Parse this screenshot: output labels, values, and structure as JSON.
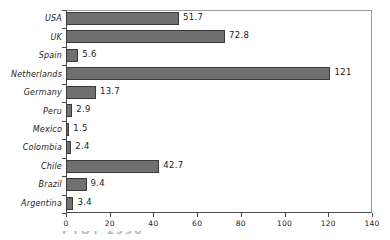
{
  "chart_data": {
    "type": "bar",
    "orientation": "horizontal",
    "title": "",
    "xlabel": "",
    "ylabel": "",
    "categories": [
      "USA",
      "UK",
      "Spain",
      "Netherlands",
      "Germany",
      "Peru",
      "Mexico",
      "Colombia",
      "Chile",
      "Brazil",
      "Argentina"
    ],
    "values": [
      51.7,
      72.8,
      5.6,
      121,
      13.7,
      2.9,
      1.5,
      2.4,
      42.7,
      9.4,
      3.4
    ],
    "value_labels": [
      "51.7",
      "72.8",
      "5.6",
      "121",
      "13.7",
      "2.9",
      "1.5",
      "2.4",
      "42.7",
      "9.4",
      "3.4"
    ],
    "xlim": [
      0,
      140
    ],
    "xticks": [
      0,
      20,
      40,
      60,
      80,
      100,
      120,
      140
    ],
    "xtick_labels": [
      "0",
      "20",
      "40",
      "60",
      "80",
      "100",
      "120",
      "140"
    ],
    "grid": false,
    "legend": null,
    "bar_color": "#707070",
    "bar_edge_color": "#3a3a3a",
    "axis_color": "#4a4a4a",
    "frame_color": "#9a9a9a",
    "background": "#ffffff",
    "text_color": "#1c1c1c"
  },
  "caption": {
    "text": "PTOT 1990"
  }
}
